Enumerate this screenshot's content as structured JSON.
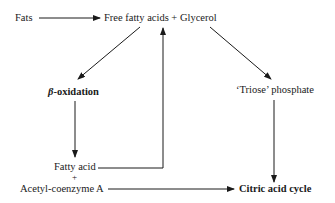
{
  "diagram": {
    "type": "flowchart",
    "nodes": {
      "fats": "Fats",
      "ffa_glycerol": "Free fatty acids + Glycerol",
      "beta_oxidation_prefix": "β",
      "beta_oxidation_suffix": "-oxidation",
      "triose_phosphate": "‘Triose’ phosphate",
      "fatty_acid": "Fatty acid",
      "plus": "+",
      "acetyl_coa": "Acetyl-coenzyme A",
      "citric_acid_cycle": "Citric acid cycle"
    },
    "edges": [
      {
        "from": "Fats",
        "to": "Free fatty acids + Glycerol"
      },
      {
        "from": "Free fatty acids + Glycerol",
        "to": "β-oxidation"
      },
      {
        "from": "Free fatty acids + Glycerol",
        "to": "‘Triose’ phosphate"
      },
      {
        "from": "β-oxidation",
        "to": "Fatty acid + Acetyl-coenzyme A"
      },
      {
        "from": "Fatty acid",
        "to": "Free fatty acids + Glycerol"
      },
      {
        "from": "Acetyl-coenzyme A",
        "to": "Citric acid cycle"
      },
      {
        "from": "‘Triose’ phosphate",
        "to": "Citric acid cycle"
      }
    ],
    "colors": {
      "ink": "#1a1a1a",
      "background": "#ffffff"
    }
  }
}
